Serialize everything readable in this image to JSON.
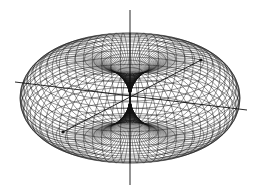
{
  "figure": {
    "title": "",
    "line_color": "#111111",
    "background": "#ffffff",
    "meridians": 72,
    "parallels": 36,
    "axes": [
      {
        "name": "z-axis",
        "label": ""
      },
      {
        "name": "x-axis",
        "label": ""
      },
      {
        "name": "y-axis",
        "label": ""
      }
    ]
  }
}
